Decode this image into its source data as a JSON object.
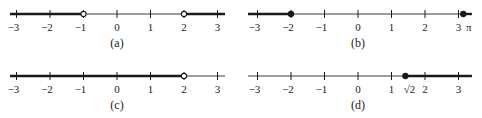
{
  "figure": {
    "colors": {
      "line": "#1a1a1a",
      "thin_line": "#3a3a3a",
      "text": "#222222",
      "point": "#1a1a1a"
    },
    "ticks": [
      -3,
      -2,
      -1,
      0,
      1,
      2,
      3
    ],
    "tick_labels": [
      "−3",
      "−2",
      "−1",
      "0",
      "1",
      "2",
      "3"
    ],
    "panels": [
      {
        "id": "a",
        "caption": "(a)",
        "origin_x": 117,
        "line_y": 14,
        "unit": 33.5,
        "line_start": 10,
        "line_end": 225,
        "thick_segments": [
          [
            -3.2,
            -1
          ],
          [
            2,
            3.25
          ]
        ],
        "points": [
          {
            "x": -1,
            "style": "open"
          },
          {
            "x": 2,
            "style": "open"
          }
        ],
        "extra_labels": []
      },
      {
        "id": "b",
        "caption": "(b)",
        "origin_x": 358,
        "line_y": 14,
        "unit": 33.5,
        "line_start": 248,
        "line_end": 472,
        "thick_segments": [
          [
            -3.3,
            -2
          ],
          [
            3.14159,
            3.4
          ]
        ],
        "points": [
          {
            "x": -2,
            "style": "filled"
          },
          {
            "x": 3.14159,
            "style": "filled"
          }
        ],
        "extra_labels": [
          {
            "x": 3.25,
            "text": "π"
          }
        ]
      },
      {
        "id": "c",
        "caption": "(c)",
        "origin_x": 117,
        "line_y": 76,
        "unit": 33.5,
        "line_start": 10,
        "line_end": 225,
        "thick_segments": [
          [
            -3.2,
            2
          ]
        ],
        "points": [
          {
            "x": 2,
            "style": "open"
          }
        ],
        "extra_labels": []
      },
      {
        "id": "d",
        "caption": "(d)",
        "origin_x": 358,
        "line_y": 76,
        "unit": 33.5,
        "line_start": 248,
        "line_end": 472,
        "thick_segments": [
          [
            1.41421,
            3.4
          ]
        ],
        "points": [
          {
            "x": 1.41421,
            "style": "filled"
          }
        ],
        "extra_labels": [
          {
            "x": 1.48,
            "text": "√2"
          }
        ]
      }
    ]
  }
}
